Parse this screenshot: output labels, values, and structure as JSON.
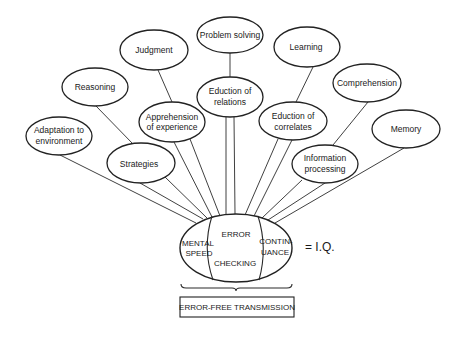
{
  "diagram": {
    "nodes": [
      {
        "id": "problem-solving",
        "lines": [
          "Problem solving"
        ]
      },
      {
        "id": "judgment",
        "lines": [
          "Judgment"
        ]
      },
      {
        "id": "learning",
        "lines": [
          "Learning"
        ]
      },
      {
        "id": "reasoning",
        "lines": [
          "Reasoning"
        ]
      },
      {
        "id": "comprehension",
        "lines": [
          "Comprehension"
        ]
      },
      {
        "id": "eduction-of-relations",
        "lines": [
          "Eduction of",
          "relations"
        ]
      },
      {
        "id": "apprehension-of-experience",
        "lines": [
          "Apprehension",
          "of experience"
        ]
      },
      {
        "id": "eduction-of-correlates",
        "lines": [
          "Eduction of",
          "correlates"
        ]
      },
      {
        "id": "adaptation-to-environment",
        "lines": [
          "Adaptation to",
          "environment"
        ]
      },
      {
        "id": "memory",
        "lines": [
          "Memory"
        ]
      },
      {
        "id": "strategies",
        "lines": [
          "Strategies"
        ]
      },
      {
        "id": "information-processing",
        "lines": [
          "Information",
          "processing"
        ]
      }
    ],
    "center": {
      "mental_speed": [
        "MENTAL",
        "SPEED"
      ],
      "error_checking_top": "ERROR",
      "error_checking_bottom": "CHECKING",
      "continuance": [
        "CONTIN-",
        "UANCE"
      ]
    },
    "equals_label": "= I.Q.",
    "bottom_box_label": "ERROR-FREE TRANSMISSION"
  }
}
